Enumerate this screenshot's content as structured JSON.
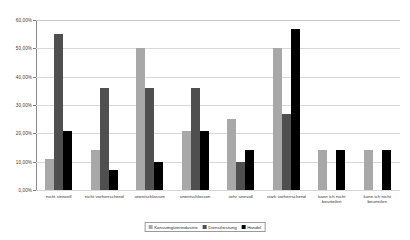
{
  "chart_data": {
    "type": "bar",
    "title": "",
    "subtitle": "",
    "xlabel": "",
    "ylabel": "",
    "ylim": [
      0,
      60
    ],
    "ytick_values": [
      0,
      10,
      20,
      30,
      40,
      50,
      60
    ],
    "ytick_labels": [
      "0,00%",
      "10,00%",
      "20,00%",
      "30,00%",
      "40,00%",
      "50,00%",
      "60,00%"
    ],
    "grid": true,
    "legend_position": "bottom-center",
    "categories": [
      "nicht sinnvoll",
      "nicht vorherrschend",
      "unentschlossen",
      "unentschlossen",
      "sehr sinnvoll",
      "stark vorherrschend",
      "kann ich nicht beurteilen",
      "kann ich nicht beurteilen"
    ],
    "series": [
      {
        "name": "Konsumgüterindustrie",
        "color": "#a8a8a8",
        "values": [
          11.0,
          14.0,
          50.0,
          21.0,
          25.0,
          50.0,
          14.0,
          14.0
        ]
      },
      {
        "name": "Dienstleistung",
        "color": "#4f4f4f",
        "values": [
          55.0,
          36.0,
          36.0,
          36.0,
          10.0,
          27.0,
          null,
          null
        ]
      },
      {
        "name": "Handel",
        "color": "#000000",
        "values": [
          21.0,
          7.0,
          10.0,
          21.0,
          14.0,
          57.0,
          14.0,
          14.0
        ]
      }
    ]
  },
  "legend": {
    "items": [
      {
        "label": "Konsumgüterindustrie"
      },
      {
        "label": "Dienstleistung"
      },
      {
        "label": "Handel"
      }
    ]
  }
}
